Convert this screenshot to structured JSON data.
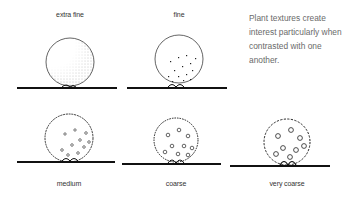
{
  "caption": "Plant textures create interest particularly when contrasted with one another.",
  "textures": [
    {
      "label": "extra fine"
    },
    {
      "label": "fine"
    },
    {
      "label": "medium"
    },
    {
      "label": "coarse"
    },
    {
      "label": "very coarse"
    }
  ]
}
